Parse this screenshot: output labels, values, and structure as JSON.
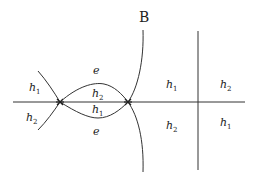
{
  "title": "B",
  "labels": {
    "left_upper": {
      "base": "h",
      "sub": "1"
    },
    "left_lower": {
      "base": "h",
      "sub": "2"
    },
    "top_e": "e",
    "bottom_e": "e",
    "lens_upper": {
      "base": "h",
      "sub": "2"
    },
    "lens_lower": {
      "base": "h",
      "sub": "1"
    },
    "mid_upper": {
      "base": "h",
      "sub": "1"
    },
    "mid_lower": {
      "base": "h",
      "sub": "2"
    },
    "right_upper": {
      "base": "h",
      "sub": "2"
    },
    "right_lower": {
      "base": "h",
      "sub": "1"
    }
  },
  "colors": {
    "stroke": "#333333"
  }
}
